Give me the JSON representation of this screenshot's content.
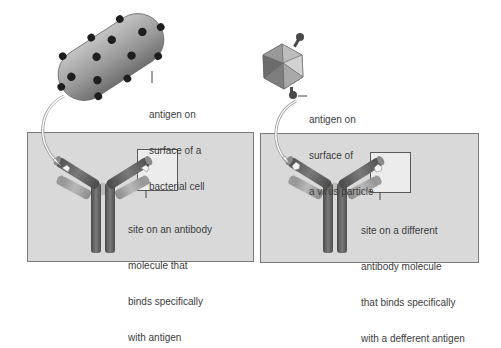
{
  "diagram": {
    "left": {
      "antigen_label": [
        "antigen on",
        "surface of a",
        "bacterial cell"
      ],
      "site_label": [
        "site on an antibody",
        "molecule that",
        "binds specifically",
        "with antigen"
      ]
    },
    "right": {
      "antigen_label": [
        "antigen on",
        "surface of",
        "a virus particle"
      ],
      "site_label": [
        "site on a different",
        "antibody molecule",
        "that binds specifically",
        "with a defferent antigen"
      ]
    },
    "colors": {
      "panel_fill": "#d9d9d9",
      "panel_border": "#7a7a7a",
      "highlight_box": "#ececec",
      "bacterium": "#9a9a9a",
      "antigen_dot": "#1e1e1e",
      "antibody_dark": "#5f5f5f",
      "antibody_light": "#a8a8a8"
    }
  }
}
